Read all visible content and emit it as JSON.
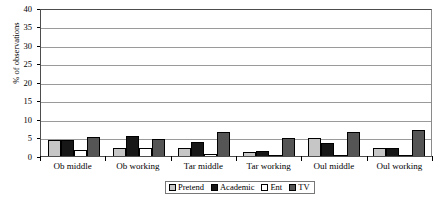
{
  "chart_data": {
    "type": "bar",
    "title": "",
    "xlabel": "",
    "ylabel": "% of observations",
    "ylim": [
      0,
      40
    ],
    "yticks": [
      0,
      5,
      10,
      15,
      20,
      25,
      30,
      35,
      40
    ],
    "grid": true,
    "legend_position": "bottom",
    "categories": [
      "Ob middle",
      "Ob working",
      "Tar middle",
      "Tar working",
      "Oul middle",
      "Oul working"
    ],
    "series": [
      {
        "name": "Pretend",
        "color": "#c6c6c6",
        "values": [
          4.3,
          2.2,
          2.3,
          1.1,
          5.0,
          2.2
        ]
      },
      {
        "name": "Academic",
        "color": "#171717",
        "values": [
          4.4,
          5.5,
          3.8,
          1.4,
          3.4,
          2.2
        ]
      },
      {
        "name": "Ent",
        "color": "#ffffff",
        "values": [
          1.5,
          2.3,
          0.5,
          0.0,
          0.3,
          0.0
        ]
      },
      {
        "name": "TV",
        "color": "#555555",
        "values": [
          5.1,
          4.6,
          6.5,
          4.8,
          6.6,
          7.1
        ]
      }
    ]
  }
}
